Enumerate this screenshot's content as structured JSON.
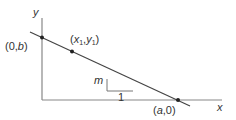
{
  "diagram": {
    "colors": {
      "line": "#444444",
      "axis": "#888888",
      "text": "#333333",
      "point": "#222222"
    },
    "axes": {
      "x_label": "x",
      "y_label": "y"
    },
    "points": [
      {
        "id": "y-intercept",
        "label": "(0,b)"
      },
      {
        "id": "point-1",
        "label_x": "x",
        "label_y": "y",
        "sub": "1"
      },
      {
        "id": "x-intercept",
        "label": "(a,0)"
      }
    ],
    "slope_triangle": {
      "rise_label": "m",
      "run_label": "1"
    },
    "labels": {
      "y_intercept_open": "(0,",
      "y_intercept_var": "b",
      "y_intercept_close": ")",
      "p1_open": "(",
      "p1_x": "x",
      "p1_sub": "1",
      "p1_comma": ",",
      "p1_y": "y",
      "p1_close": ")",
      "x_intercept_open": "(",
      "x_intercept_var": "a",
      "x_intercept_close": ",0)"
    }
  }
}
